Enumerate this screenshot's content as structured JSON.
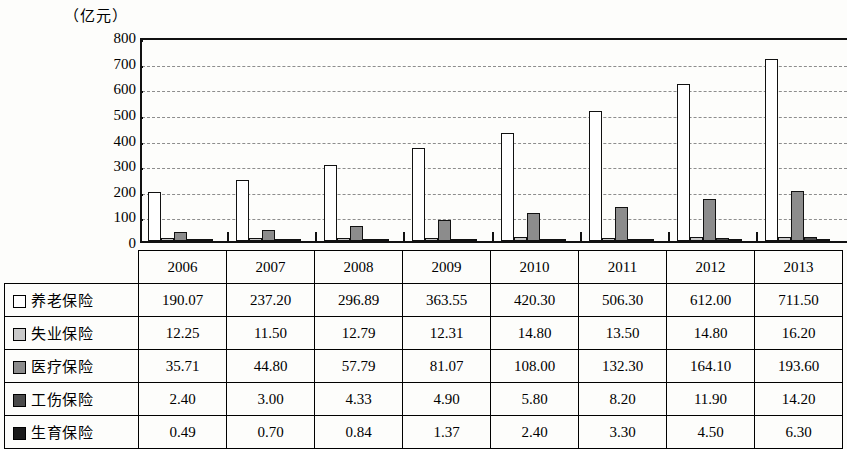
{
  "unit_label": "（亿元）",
  "chart_data": {
    "type": "bar",
    "title": "",
    "subtitle": "",
    "xlabel": "",
    "ylabel": "（亿元）",
    "ylim": [
      0,
      800
    ],
    "ytick_step": 100,
    "yticks": [
      "800",
      "700",
      "600",
      "500",
      "400",
      "300",
      "200",
      "100",
      "0"
    ],
    "grid": true,
    "grid_style": "dashed-horizontal",
    "legend_position": "table-row-labels",
    "categories": [
      "2006",
      "2007",
      "2008",
      "2009",
      "2010",
      "2011",
      "2012",
      "2013"
    ],
    "series": [
      {
        "name": "养老保险",
        "color": "#ffffff",
        "values": [
          190.07,
          237.2,
          296.89,
          363.55,
          420.3,
          506.3,
          612.0,
          711.5
        ]
      },
      {
        "name": "失业保险",
        "color": "#c9c9c9",
        "values": [
          12.25,
          11.5,
          12.79,
          12.31,
          14.8,
          13.5,
          14.8,
          16.2
        ]
      },
      {
        "name": "医疗保险",
        "color": "#8c8c8c",
        "values": [
          35.71,
          44.8,
          57.79,
          81.07,
          108.0,
          132.3,
          164.1,
          193.6
        ]
      },
      {
        "name": "工伤保险",
        "color": "#4a4a4a",
        "values": [
          2.4,
          3.0,
          4.33,
          4.9,
          5.8,
          8.2,
          11.9,
          14.2
        ]
      },
      {
        "name": "生育保险",
        "color": "#1a1a1a",
        "values": [
          0.49,
          0.7,
          0.84,
          1.37,
          2.4,
          3.3,
          4.5,
          6.3
        ]
      }
    ]
  },
  "table": {
    "corner_label": "",
    "column_headers": [
      "2006",
      "2007",
      "2008",
      "2009",
      "2010",
      "2011",
      "2012",
      "2013"
    ],
    "rows": [
      {
        "label": "养老保险",
        "swatch_color": "#ffffff",
        "values": [
          "190.07",
          "237.20",
          "296.89",
          "363.55",
          "420.30",
          "506.30",
          "612.00",
          "711.50"
        ]
      },
      {
        "label": "失业保险",
        "swatch_color": "#c9c9c9",
        "values": [
          "12.25",
          "11.50",
          "12.79",
          "12.31",
          "14.80",
          "13.50",
          "14.80",
          "16.20"
        ]
      },
      {
        "label": "医疗保险",
        "swatch_color": "#8c8c8c",
        "values": [
          "35.71",
          "44.80",
          "57.79",
          "81.07",
          "108.00",
          "132.30",
          "164.10",
          "193.60"
        ]
      },
      {
        "label": "工伤保险",
        "swatch_color": "#4a4a4a",
        "values": [
          "2.40",
          "3.00",
          "4.33",
          "4.90",
          "5.80",
          "8.20",
          "11.90",
          "14.20"
        ]
      },
      {
        "label": "生育保险",
        "swatch_color": "#1a1a1a",
        "values": [
          "0.49",
          "0.70",
          "0.84",
          "1.37",
          "2.40",
          "3.30",
          "4.50",
          "6.30"
        ]
      }
    ]
  }
}
